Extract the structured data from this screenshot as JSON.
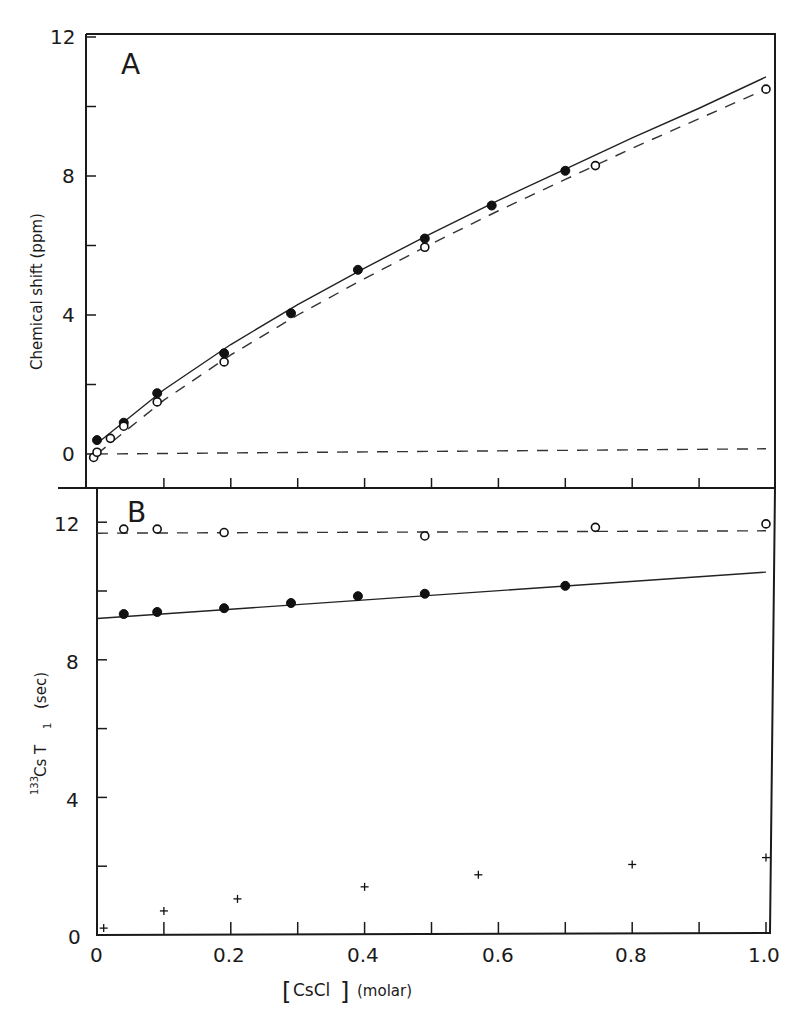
{
  "chart_data": [
    {
      "panel": "A",
      "type": "scatter",
      "title": "A",
      "xlabel": "[CsCl] (molar)",
      "ylabel": "Chemical shift (ppm)",
      "xlim": [
        0,
        1.0
      ],
      "ylim": [
        0,
        12
      ],
      "yticks": [
        0,
        4,
        8,
        12
      ],
      "grid": false,
      "series": [
        {
          "name": "filled circles",
          "marker": "filled-circle",
          "x": [
            0.0,
            0.04,
            0.09,
            0.19,
            0.29,
            0.39,
            0.49,
            0.59,
            0.7
          ],
          "y": [
            0.4,
            0.9,
            1.75,
            2.9,
            4.05,
            5.3,
            6.2,
            7.15,
            8.15
          ]
        },
        {
          "name": "open circles",
          "marker": "open-circle",
          "x": [
            -0.005,
            0.0,
            0.02,
            0.04,
            0.09,
            0.19,
            0.49,
            0.745,
            1.0
          ],
          "y": [
            -0.1,
            0.05,
            0.45,
            0.8,
            1.5,
            2.65,
            5.95,
            8.3,
            10.5
          ]
        },
        {
          "name": "solid fit",
          "line": "solid",
          "x": [
            0.0,
            0.1,
            0.2,
            0.3,
            0.4,
            0.5,
            0.6,
            0.7,
            0.8,
            0.9,
            1.0
          ],
          "y": [
            0.3,
            1.85,
            3.15,
            4.3,
            5.35,
            6.35,
            7.3,
            8.2,
            9.1,
            9.95,
            10.85
          ]
        },
        {
          "name": "dashed fit",
          "line": "dashed",
          "x": [
            0.0,
            0.1,
            0.2,
            0.3,
            0.4,
            0.5,
            0.6,
            0.7,
            0.8,
            0.9,
            1.0
          ],
          "y": [
            0.0,
            1.55,
            2.85,
            4.0,
            5.05,
            6.05,
            7.0,
            7.9,
            8.8,
            9.65,
            10.5
          ]
        },
        {
          "name": "baseline",
          "line": "dashed",
          "x": [
            0.0,
            1.0
          ],
          "y": [
            0.0,
            0.15
          ]
        }
      ]
    },
    {
      "panel": "B",
      "type": "scatter",
      "title": "B",
      "xlabel": "[CsCl] (molar)",
      "ylabel": "133Cs T1 (sec)",
      "xlim": [
        0,
        1.0
      ],
      "ylim": [
        0,
        12
      ],
      "xticks": [
        0,
        0.2,
        0.4,
        0.6,
        0.8,
        1.0
      ],
      "yticks": [
        0,
        4,
        8,
        12
      ],
      "grid": false,
      "series": [
        {
          "name": "open circles",
          "marker": "open-circle",
          "x": [
            0.04,
            0.09,
            0.19,
            0.49,
            0.745,
            1.0
          ],
          "y": [
            11.8,
            11.8,
            11.7,
            11.6,
            11.85,
            11.95
          ]
        },
        {
          "name": "filled circles",
          "marker": "filled-circle",
          "x": [
            0.04,
            0.09,
            0.19,
            0.29,
            0.39,
            0.49,
            0.7
          ],
          "y": [
            9.33,
            9.39,
            9.5,
            9.65,
            9.85,
            9.92,
            10.15
          ]
        },
        {
          "name": "crosses",
          "marker": "plus",
          "x": [
            0.01,
            0.1,
            0.21,
            0.4,
            0.57,
            0.8,
            1.0
          ],
          "y": [
            0.2,
            0.7,
            1.05,
            1.4,
            1.75,
            2.05,
            2.25
          ]
        },
        {
          "name": "solid fit",
          "line": "solid",
          "x": [
            0.0,
            1.0
          ],
          "y": [
            9.2,
            10.55
          ]
        },
        {
          "name": "dashed fit",
          "line": "dashed",
          "x": [
            0.0,
            1.0
          ],
          "y": [
            11.68,
            11.75
          ]
        }
      ]
    }
  ],
  "labels": {
    "panel_a": "A",
    "panel_b": "B",
    "a_yticks": [
      "12",
      "8",
      "4",
      "0"
    ],
    "b_yticks": [
      "12",
      "8",
      "4",
      "0"
    ],
    "xticks": [
      "0",
      "0.2",
      "0.4",
      "0.6",
      "0.8",
      "1.0"
    ],
    "a_ylabel": "Chemical shift (ppm)",
    "b_ylabel_sup": "133",
    "b_ylabel_main": "Cs  T",
    "b_ylabel_sub": "1",
    "b_ylabel_unit": "(sec)",
    "xlabel_bracket_left": "[",
    "xlabel_species": "CsCl",
    "xlabel_bracket_right": "]",
    "xlabel_unit": "(molar)"
  }
}
